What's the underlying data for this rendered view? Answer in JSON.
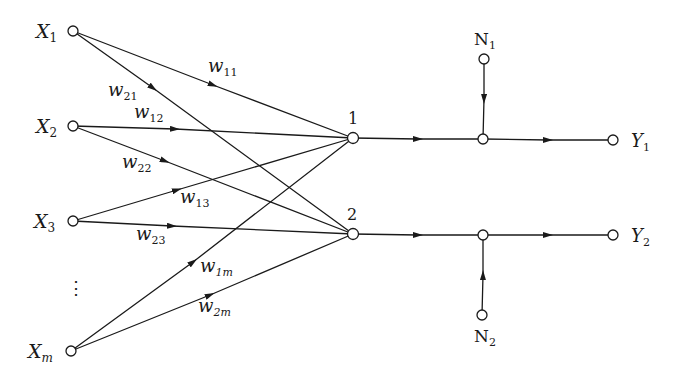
{
  "diagram": {
    "type": "neural-network-signal-flow",
    "inputs": [
      {
        "id": "X1",
        "label": "X",
        "sub": "1",
        "x": 73,
        "y": 31
      },
      {
        "id": "X2",
        "label": "X",
        "sub": "2",
        "x": 73,
        "y": 126
      },
      {
        "id": "X3",
        "label": "X",
        "sub": "3",
        "x": 73,
        "y": 221
      },
      {
        "id": "Xm",
        "label": "X",
        "sub": "m",
        "x": 71,
        "y": 351
      }
    ],
    "ellipsis": "⋮",
    "neurons": [
      {
        "id": "n1",
        "label": "1",
        "x": 353,
        "y": 138
      },
      {
        "id": "n2",
        "label": "2",
        "x": 353,
        "y": 234
      }
    ],
    "weights": [
      {
        "from": "X1",
        "to": "n1",
        "label": "w",
        "sub": "11"
      },
      {
        "from": "X1",
        "to": "n2",
        "label": "w",
        "sub": "21"
      },
      {
        "from": "X2",
        "to": "n1",
        "label": "w",
        "sub": "12"
      },
      {
        "from": "X2",
        "to": "n2",
        "label": "w",
        "sub": "22"
      },
      {
        "from": "X3",
        "to": "n1",
        "label": "w",
        "sub": "13"
      },
      {
        "from": "X3",
        "to": "n2",
        "label": "w",
        "sub": "23"
      },
      {
        "from": "Xm",
        "to": "n1",
        "label": "w",
        "sub": "1m"
      },
      {
        "from": "Xm",
        "to": "n2",
        "label": "w",
        "sub": "2m"
      }
    ],
    "noise": [
      {
        "id": "N1",
        "label": "N",
        "sub": "1",
        "x": 484,
        "y": 59,
        "junction_x": 483,
        "junction_y": 139
      },
      {
        "id": "N2",
        "label": "N",
        "sub": "2",
        "x": 482,
        "y": 315,
        "junction_x": 483,
        "junction_y": 235
      }
    ],
    "outputs": [
      {
        "id": "Y1",
        "label": "Y",
        "sub": "1",
        "x": 613,
        "y": 140
      },
      {
        "id": "Y2",
        "label": "Y",
        "sub": "2",
        "x": 613,
        "y": 235
      }
    ]
  }
}
